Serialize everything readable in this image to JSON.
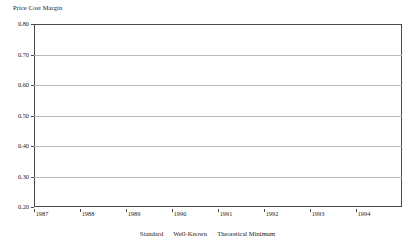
{
  "chart_data": {
    "type": "line",
    "subtype": "step",
    "title": "Price Cost Margin",
    "ylabel": "Price Cost Margin",
    "xlabel": "",
    "ylim": [
      0.2,
      0.8
    ],
    "xlim": [
      1987.0,
      1995.0
    ],
    "ytick_labels": [
      "0.20",
      "0.30",
      "0.40",
      "0.50",
      "0.60",
      "0.70",
      "0.80"
    ],
    "ytick_values": [
      0.2,
      0.3,
      0.4,
      0.5,
      0.6,
      0.7,
      0.8
    ],
    "xtick_labels": [
      "1987",
      "1988",
      "1989",
      "1990",
      "1991",
      "1992",
      "1993",
      "1994"
    ],
    "xtick_values": [
      1987,
      1988,
      1989,
      1990,
      1991,
      1992,
      1993,
      1994
    ],
    "grid": true,
    "grid_axis": "y",
    "legend_position": "bottom",
    "legend": [
      "Standard",
      "Well-Known",
      "Theoretical Minimum"
    ],
    "series": [
      {
        "name": "Standard",
        "style": "solid",
        "color": "#3d3d3d",
        "x": [
          1987.0,
          1987.17,
          1987.33,
          1987.5,
          1987.67,
          1987.83,
          1988.0,
          1988.17,
          1988.33,
          1988.5,
          1988.67,
          1988.83,
          1989.0,
          1989.17,
          1989.33,
          1989.5,
          1989.67,
          1989.83,
          1990.0,
          1990.17,
          1990.33,
          1990.5,
          1990.67,
          1990.83,
          1991.0,
          1991.17,
          1991.33,
          1991.5,
          1991.67,
          1991.83,
          1992.0,
          1992.17,
          1992.33,
          1992.5,
          1992.67,
          1992.83,
          1993.0,
          1993.25,
          1993.5,
          1993.75,
          1994.0,
          1994.25,
          1994.5,
          1994.75,
          1995.0
        ],
        "values": [
          0.59,
          0.59,
          0.525,
          0.525,
          0.545,
          0.545,
          0.545,
          0.595,
          0.595,
          0.543,
          0.543,
          0.543,
          0.543,
          0.58,
          0.555,
          0.59,
          0.555,
          0.553,
          0.548,
          0.548,
          0.605,
          0.605,
          0.605,
          0.622,
          0.608,
          0.608,
          0.632,
          0.632,
          0.65,
          0.65,
          0.65,
          0.65,
          0.65,
          0.66,
          0.66,
          0.66,
          0.66,
          0.66,
          0.66,
          0.668,
          0.668,
          0.69,
          0.69,
          0.69,
          0.69
        ]
      },
      {
        "name": "Well-Known",
        "style": "dashed",
        "color": "#3d3d3d",
        "x": [
          1987.0,
          1987.17,
          1987.33,
          1987.5,
          1987.67,
          1987.83,
          1988.0,
          1988.17,
          1988.33,
          1988.5,
          1988.67,
          1988.83,
          1989.0,
          1989.17,
          1989.33,
          1989.5,
          1989.67,
          1989.83,
          1990.0,
          1990.17,
          1990.33,
          1990.5,
          1990.67,
          1990.83,
          1991.0,
          1991.17,
          1991.33,
          1991.5,
          1991.67,
          1991.83,
          1992.0,
          1992.17,
          1992.33,
          1992.5,
          1992.67,
          1992.83,
          1993.0,
          1993.25,
          1993.5,
          1993.75,
          1994.0,
          1994.25,
          1994.5,
          1994.75,
          1995.0
        ],
        "values": [
          0.575,
          0.575,
          0.505,
          0.505,
          0.528,
          0.528,
          0.528,
          0.582,
          0.582,
          0.527,
          0.527,
          0.527,
          0.527,
          0.565,
          0.54,
          0.572,
          0.523,
          0.522,
          0.522,
          0.522,
          0.578,
          0.562,
          0.562,
          0.575,
          0.562,
          0.562,
          0.575,
          0.575,
          0.572,
          0.572,
          0.572,
          0.572,
          0.572,
          0.595,
          0.595,
          0.595,
          0.595,
          0.595,
          0.595,
          0.595,
          0.595,
          0.595,
          0.598,
          0.598,
          0.598
        ]
      },
      {
        "name": "Theoretical Minimum",
        "style": "solid",
        "color": "#3d3d3d",
        "x": [],
        "values": []
      }
    ]
  }
}
